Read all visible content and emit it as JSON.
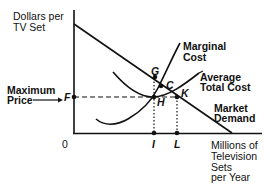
{
  "diagram": {
    "type": "economics-cost-curves",
    "y_axis_label_line1": "Dollars per",
    "y_axis_label_line2": "TV Set",
    "x_axis_label_line1": "Millions of",
    "x_axis_label_line2": "Television",
    "x_axis_label_line3": "Sets",
    "x_axis_label_line4": "per Year",
    "origin": "0",
    "max_price_line1": "Maximum",
    "max_price_line2": "Price",
    "max_price_point": "F",
    "curves": {
      "marginal_cost_line1": "Marginal",
      "marginal_cost_line2": "Cost",
      "atc_line1": "Average",
      "atc_line2": "Total Cost",
      "demand_line1": "Market",
      "demand_line2": "Demand"
    },
    "points": {
      "G": "G",
      "C": "C",
      "H": "H",
      "K": "K",
      "I": "I",
      "L": "L"
    }
  }
}
